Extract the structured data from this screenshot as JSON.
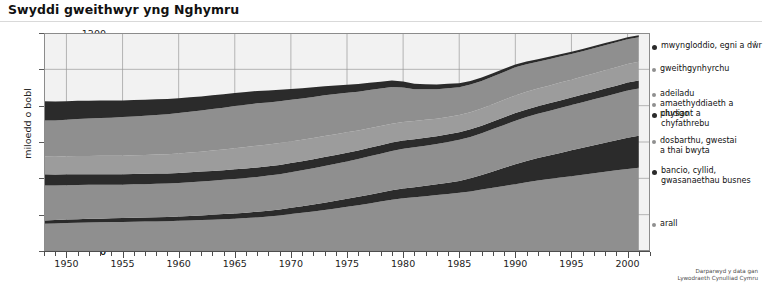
{
  "header": {
    "title": "Swyddi gweithwyr yng Nghymru"
  },
  "footer": {
    "credit": "Darparwyd y data gan\nLywodraeth Cynulliad Cymru"
  },
  "legend": {
    "items": [
      {
        "label": "mwyngloddio, egni a dŵr",
        "color": "#2b2b2b",
        "marker": "big",
        "top": 8
      },
      {
        "label": "gweithgynhyrchu",
        "color": "#8f8f8f",
        "marker": "small",
        "top": 31
      },
      {
        "label": "adeiladu",
        "color": "#8f8f8f",
        "marker": "small",
        "top": 56
      },
      {
        "label": "amaethyddiaeth a physgo",
        "color": "#8f8f8f",
        "marker": "small",
        "top": 66
      },
      {
        "label": "cludiant a\nchyfathrebu",
        "color": "#2b2b2b",
        "marker": "big",
        "top": 76
      },
      {
        "label": "dosbarthu, gwestai\na thai bwyta",
        "color": "#8f8f8f",
        "marker": "small",
        "top": 103
      },
      {
        "label": "bancio, cyllid,\ngwasanaethau busnes",
        "color": "#2b2b2b",
        "marker": "big",
        "top": 133
      },
      {
        "label": "arall",
        "color": "#8f8f8f",
        "marker": "small",
        "top": 186
      }
    ]
  },
  "chart_data": {
    "type": "area",
    "stacked": true,
    "title": "Swyddi gweithwyr yng Nghymru",
    "xlabel": "",
    "ylabel": "miloedd o bobl",
    "ylim": [
      0,
      1200
    ],
    "yticks": [
      0,
      200,
      400,
      600,
      800,
      1000,
      1200
    ],
    "xlim": [
      1948,
      2002
    ],
    "xticks_major": [
      1950,
      1955,
      1960,
      1965,
      1970,
      1975,
      1980,
      1985,
      1990,
      1995,
      2000
    ],
    "xtick_interval": 1,
    "grid": true,
    "legend_position": "right",
    "x": [
      1948,
      1949,
      1950,
      1951,
      1952,
      1953,
      1954,
      1955,
      1956,
      1957,
      1958,
      1959,
      1960,
      1961,
      1962,
      1963,
      1964,
      1965,
      1966,
      1967,
      1968,
      1969,
      1970,
      1971,
      1972,
      1973,
      1974,
      1975,
      1976,
      1977,
      1978,
      1979,
      1980,
      1981,
      1982,
      1983,
      1984,
      1985,
      1986,
      1987,
      1988,
      1989,
      1990,
      1991,
      1992,
      1993,
      1994,
      1995,
      1996,
      1997,
      1998,
      1999,
      2000,
      2001
    ],
    "series": [
      {
        "name": "arall",
        "color": "#8f8f8f",
        "values": [
          150,
          152,
          154,
          156,
          157,
          158,
          159,
          160,
          161,
          162,
          163,
          164,
          166,
          168,
          170,
          172,
          175,
          178,
          181,
          185,
          190,
          196,
          203,
          210,
          218,
          226,
          234,
          243,
          252,
          262,
          272,
          282,
          290,
          296,
          302,
          308,
          314,
          320,
          328,
          338,
          348,
          358,
          368,
          378,
          388,
          396,
          404,
          412,
          420,
          428,
          436,
          444,
          452,
          458
        ]
      },
      {
        "name": "bancio, cyllid, gwasanaethau busnes",
        "color": "#2b2b2b",
        "values": [
          18,
          18,
          19,
          19,
          20,
          20,
          21,
          21,
          22,
          22,
          23,
          23,
          24,
          25,
          26,
          27,
          28,
          29,
          30,
          31,
          32,
          33,
          35,
          36,
          38,
          40,
          42,
          44,
          46,
          48,
          50,
          52,
          54,
          55,
          57,
          59,
          62,
          66,
          72,
          80,
          90,
          100,
          110,
          118,
          124,
          130,
          136,
          142,
          148,
          154,
          160,
          166,
          172,
          176
        ]
      },
      {
        "name": "dosbarthu, gwestai a thai bwyta",
        "color": "#8f8f8f",
        "values": [
          192,
          190,
          189,
          188,
          187,
          186,
          185,
          184,
          184,
          184,
          184,
          184,
          185,
          186,
          187,
          188,
          189,
          190,
          191,
          192,
          193,
          194,
          196,
          198,
          200,
          202,
          204,
          206,
          208,
          211,
          214,
          217,
          219,
          220,
          221,
          222,
          224,
          226,
          228,
          230,
          233,
          236,
          239,
          241,
          243,
          245,
          247,
          249,
          251,
          253,
          255,
          257,
          259,
          260
        ]
      },
      {
        "name": "cludiant a chyfathrebu",
        "color": "#2b2b2b",
        "values": [
          62,
          61,
          60,
          60,
          59,
          59,
          58,
          58,
          57,
          57,
          56,
          56,
          55,
          55,
          54,
          54,
          53,
          53,
          52,
          52,
          51,
          51,
          50,
          50,
          49,
          49,
          48,
          48,
          47,
          47,
          46,
          46,
          45,
          44,
          44,
          43,
          43,
          42,
          42,
          42,
          42,
          42,
          42,
          42,
          42,
          42,
          42,
          42,
          42,
          42,
          43,
          43,
          44,
          44
        ]
      },
      {
        "name": "amaethyddiaeth a physgota / adeiladu",
        "color": "#9c9c9c",
        "values": [
          98,
          98,
          99,
          100,
          100,
          101,
          101,
          102,
          103,
          104,
          105,
          106,
          107,
          108,
          110,
          112,
          114,
          116,
          118,
          120,
          120,
          120,
          119,
          118,
          117,
          116,
          114,
          112,
          110,
          108,
          106,
          104,
          102,
          100,
          98,
          96,
          95,
          94,
          94,
          94,
          95,
          96,
          97,
          97,
          97,
          97,
          98,
          98,
          99,
          100,
          101,
          102,
          103,
          104
        ]
      },
      {
        "name": "gweithgynhyrchu",
        "color": "#8f8f8f",
        "values": [
          198,
          200,
          202,
          204,
          206,
          208,
          210,
          212,
          214,
          216,
          218,
          220,
          222,
          224,
          226,
          228,
          230,
          232,
          233,
          233,
          232,
          231,
          230,
          228,
          226,
          224,
          222,
          218,
          214,
          210,
          206,
          202,
          190,
          176,
          168,
          162,
          158,
          154,
          152,
          152,
          153,
          154,
          155,
          152,
          148,
          145,
          143,
          141,
          140,
          139,
          138,
          137,
          136,
          134
        ]
      },
      {
        "name": "mwyngloddio, egni a dŵr",
        "color": "#2b2b2b",
        "values": [
          106,
          104,
          102,
          100,
          98,
          96,
          94,
          92,
          90,
          88,
          86,
          84,
          82,
          80,
          78,
          76,
          74,
          72,
          70,
          68,
          65,
          62,
          59,
          56,
          53,
          50,
          47,
          44,
          42,
          40,
          38,
          36,
          33,
          30,
          28,
          26,
          24,
          22,
          20,
          19,
          18,
          17,
          16,
          15,
          14,
          14,
          13,
          13,
          12,
          12,
          12,
          11,
          11,
          11
        ]
      }
    ]
  }
}
